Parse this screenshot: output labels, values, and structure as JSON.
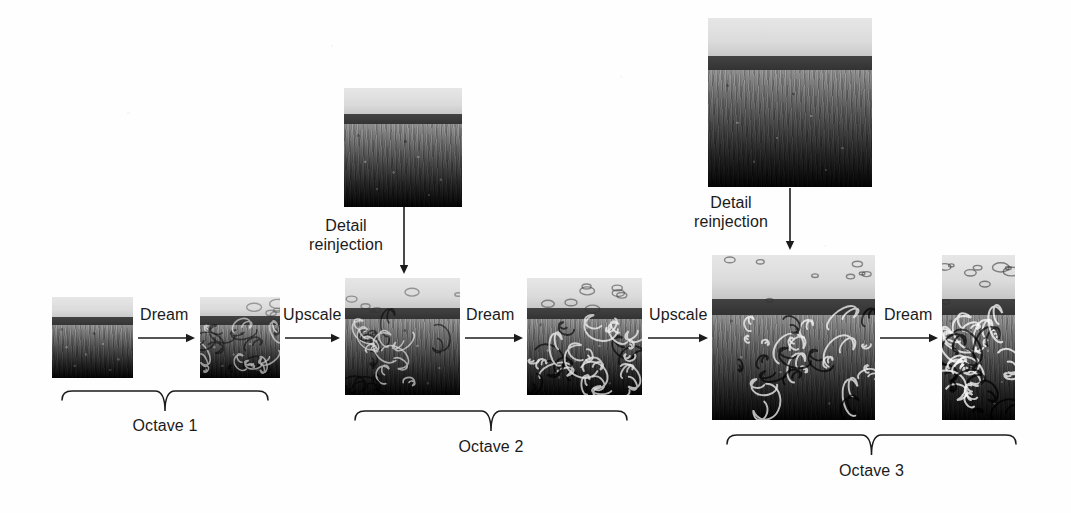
{
  "diagram": {
    "background_color": "#fefefe",
    "ink_color": "#1b1b1b",
    "octaves": [
      {
        "id": "octave-1",
        "label": "Octave 1",
        "brace": {
          "x": 62,
          "y": 388,
          "width": 206,
          "height": 24
        },
        "label_pos": {
          "x": 62,
          "y": 416,
          "width": 206
        }
      },
      {
        "id": "octave-2",
        "label": "Octave 2",
        "brace": {
          "x": 355,
          "y": 408,
          "width": 272,
          "height": 24
        },
        "label_pos": {
          "x": 355,
          "y": 437,
          "width": 272
        }
      },
      {
        "id": "octave-3",
        "label": "Octave 3",
        "brace": {
          "x": 727,
          "y": 432,
          "width": 289,
          "height": 24
        },
        "label_pos": {
          "x": 727,
          "y": 461,
          "width": 289
        }
      }
    ],
    "images": [
      {
        "id": "img-oct1-input",
        "alt": "grass field landscape, small, original",
        "x": 52,
        "y": 297,
        "width": 81,
        "height": 81,
        "dream": 0.0,
        "sky_h": 24,
        "ridge_y": 20,
        "ridge_h": 10
      },
      {
        "id": "img-oct1-dreamed",
        "alt": "grass field landscape, small, dreamed",
        "x": 200,
        "y": 297,
        "width": 80,
        "height": 81,
        "dream": 0.55,
        "sky_h": 22,
        "ridge_y": 19,
        "ridge_h": 11
      },
      {
        "id": "img-detail-1",
        "alt": "grass field landscape, detail patch for octave 2",
        "x": 344,
        "y": 88,
        "width": 118,
        "height": 119,
        "dream": 0.0,
        "sky_h": 30,
        "ridge_y": 26,
        "ridge_h": 12
      },
      {
        "id": "img-oct2-input",
        "alt": "grass field landscape, medium, upscaled plus detail",
        "x": 345,
        "y": 278,
        "width": 115,
        "height": 117,
        "dream": 0.62,
        "sky_h": 34,
        "ridge_y": 30,
        "ridge_h": 13
      },
      {
        "id": "img-oct2-dreamed",
        "alt": "grass field landscape, medium, dreamed",
        "x": 527,
        "y": 278,
        "width": 115,
        "height": 117,
        "dream": 0.85,
        "sky_h": 34,
        "ridge_y": 30,
        "ridge_h": 13
      },
      {
        "id": "img-detail-2",
        "alt": "grass field landscape, detail patch for octave 3",
        "x": 708,
        "y": 18,
        "width": 164,
        "height": 169,
        "dream": 0.0,
        "sky_h": 44,
        "ridge_y": 38,
        "ridge_h": 16
      },
      {
        "id": "img-oct3-input",
        "alt": "grass field landscape, large, upscaled plus detail",
        "x": 712,
        "y": 255,
        "width": 163,
        "height": 165,
        "dream": 0.9,
        "sky_h": 48,
        "ridge_y": 44,
        "ridge_h": 18
      },
      {
        "id": "img-oct3-dreamed",
        "alt": "grass field landscape, large, dreamed, cropped at right edge",
        "x": 942,
        "y": 255,
        "width": 73,
        "height": 165,
        "dream": 1.0,
        "sky_h": 48,
        "ridge_y": 44,
        "ridge_h": 18
      }
    ],
    "steps": [
      {
        "id": "step-dream-1",
        "label": "Dream",
        "label_x": 140,
        "label_y": 305,
        "arrow": {
          "x": 138,
          "y": 338,
          "length": 57
        }
      },
      {
        "id": "step-upscale-1",
        "label": "Upscale",
        "label_x": 283,
        "label_y": 305,
        "arrow": {
          "x": 285,
          "y": 338,
          "length": 55
        }
      },
      {
        "id": "step-dream-2",
        "label": "Dream",
        "label_x": 466,
        "label_y": 305,
        "arrow": {
          "x": 465,
          "y": 338,
          "length": 58
        }
      },
      {
        "id": "step-upscale-2",
        "label": "Upscale",
        "label_x": 649,
        "label_y": 305,
        "arrow": {
          "x": 648,
          "y": 338,
          "length": 60
        }
      },
      {
        "id": "step-dream-3",
        "label": "Dream",
        "label_x": 884,
        "label_y": 305,
        "arrow": {
          "x": 880,
          "y": 338,
          "length": 58
        }
      }
    ],
    "reinjections": [
      {
        "id": "detail-reinjection-1",
        "label": "Detail\nreinjection",
        "label_x": 303,
        "label_y": 216,
        "label_width": 86,
        "arrow": {
          "x": 404,
          "y": 207,
          "length": 67
        }
      },
      {
        "id": "detail-reinjection-2",
        "label": "Detail\nreinjection",
        "label_x": 688,
        "label_y": 193,
        "label_width": 86,
        "arrow": {
          "x": 790,
          "y": 188,
          "length": 62
        }
      }
    ]
  }
}
